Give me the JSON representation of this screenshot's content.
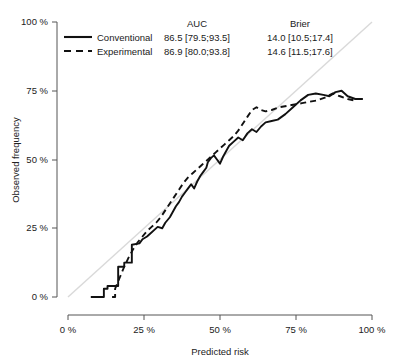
{
  "chart_data": {
    "type": "line",
    "title": "",
    "xlabel": "Predicted risk",
    "ylabel": "Observed frequency",
    "xlim": [
      0,
      100
    ],
    "ylim": [
      0,
      100
    ],
    "grid": false,
    "xticks": [
      "0 %",
      "25 %",
      "50 %",
      "75 %",
      "100 %"
    ],
    "xtick_values": [
      0,
      25,
      50,
      75,
      100
    ],
    "yticks": [
      "0 %",
      "25 %",
      "50 %",
      "75 %",
      "100 %"
    ],
    "ytick_values": [
      0,
      25,
      50,
      75,
      100
    ],
    "reference_line": {
      "name": "diagonal-identity-line",
      "from": [
        0,
        0
      ],
      "to": [
        100,
        100
      ],
      "color": "#d9d9d9",
      "style": "solid"
    },
    "legend_position": "top-left",
    "series": [
      {
        "name": "Conventional",
        "style": "solid",
        "color": "#111111",
        "x": [
          7.5,
          11.8,
          11.8,
          13.0,
          13.0,
          16.5,
          16.5,
          18.5,
          18.5,
          21.0,
          21.0,
          23.5,
          24.5,
          26.0,
          27.0,
          28.5,
          29.5,
          31.0,
          32.0,
          33.5,
          34.5,
          35.5,
          36.5,
          37.5,
          38.5,
          39.5,
          40.5,
          41.5,
          42.5,
          43.5,
          44.5,
          45.5,
          46.0,
          47.0,
          48.0,
          49.0,
          50.0,
          51.0,
          52.0,
          53.0,
          54.5,
          56.0,
          57.5,
          59.0,
          60.5,
          62.0,
          63.5,
          65.0,
          67.0,
          69.0,
          71.5,
          74.0,
          76.5,
          79.0,
          81.5,
          84.0,
          86.0,
          88.0,
          90.0,
          92.0,
          94.5,
          97.0
        ],
        "y": [
          0.0,
          0.0,
          3.0,
          3.0,
          4.0,
          4.0,
          11.0,
          11.0,
          12.5,
          12.5,
          19.0,
          19.5,
          21.0,
          22.0,
          23.0,
          24.5,
          25.5,
          25.0,
          27.0,
          29.0,
          31.0,
          33.0,
          34.5,
          36.5,
          38.0,
          39.5,
          41.0,
          39.5,
          42.0,
          44.0,
          45.5,
          47.0,
          49.0,
          50.5,
          51.5,
          50.0,
          48.5,
          51.0,
          53.0,
          55.0,
          56.5,
          58.0,
          57.0,
          59.5,
          61.0,
          60.0,
          62.0,
          63.5,
          64.0,
          64.5,
          66.5,
          69.0,
          71.5,
          73.5,
          74.0,
          73.5,
          73.0,
          74.5,
          75.0,
          73.0,
          72.0,
          72.0
        ]
      },
      {
        "name": "Experimental",
        "style": "dashed",
        "color": "#111111",
        "x": [
          14.5,
          15.5,
          15.5,
          17.0,
          18.5,
          20.0,
          21.5,
          23.0,
          24.5,
          26.0,
          27.5,
          29.0,
          30.5,
          32.0,
          33.5,
          35.0,
          36.5,
          38.0,
          39.5,
          41.0,
          42.5,
          44.0,
          45.5,
          47.0,
          48.5,
          50.0,
          51.5,
          53.0,
          54.5,
          56.0,
          57.5,
          59.0,
          60.5,
          62.0,
          63.5,
          65.0,
          67.0,
          69.5,
          72.0,
          74.5,
          77.0,
          79.5,
          82.0,
          84.5,
          87.0,
          89.5,
          92.0,
          94.0
        ],
        "y": [
          0.0,
          0.0,
          3.0,
          7.0,
          11.0,
          14.5,
          17.5,
          20.0,
          22.0,
          24.0,
          25.5,
          27.0,
          29.0,
          31.5,
          34.0,
          36.5,
          39.0,
          41.5,
          43.5,
          45.0,
          46.5,
          48.0,
          49.5,
          51.0,
          52.5,
          54.0,
          55.5,
          57.0,
          58.5,
          60.5,
          63.0,
          65.5,
          68.0,
          69.0,
          68.0,
          67.5,
          68.0,
          69.0,
          69.5,
          70.0,
          70.5,
          71.0,
          71.5,
          72.5,
          74.0,
          73.0,
          72.0,
          71.5
        ]
      }
    ]
  },
  "legend": {
    "columns": [
      "AUC",
      "Brier"
    ],
    "rows": [
      {
        "label": "Conventional",
        "style": "solid",
        "auc": "86.5 [79.5;93.5]",
        "brier": "14.0 [10.5;17.4]"
      },
      {
        "label": "Experimental",
        "style": "dashed",
        "auc": "86.9 [80.0;93.8]",
        "brier": "14.6 [11.5;17.6]"
      }
    ]
  }
}
